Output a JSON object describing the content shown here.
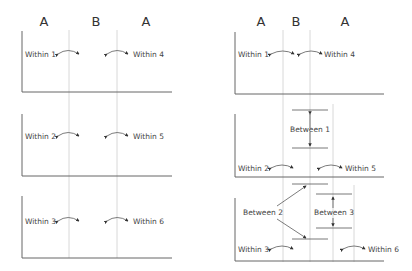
{
  "left_diagram": {
    "headers": [
      "A",
      "B",
      "A"
    ],
    "panels": [
      {
        "left_label": "Within 1",
        "right_label": "Within 4"
      },
      {
        "left_label": "Within 2",
        "right_label": "Within 5"
      },
      {
        "left_label": "Within 3",
        "right_label": "Within 6"
      }
    ]
  },
  "right_diagram": {
    "headers": [
      "A",
      "B",
      "A"
    ],
    "panels": [
      {
        "left_label": "Within 1",
        "right_label": "Within 4"
      },
      {
        "left_label": "Within 2",
        "right_label": "Within 5",
        "between_label": "Between 1"
      },
      {
        "left_label": "Within 3",
        "right_label": "Within 6",
        "between_labels": [
          "Between 2",
          "Between 3"
        ]
      }
    ]
  }
}
